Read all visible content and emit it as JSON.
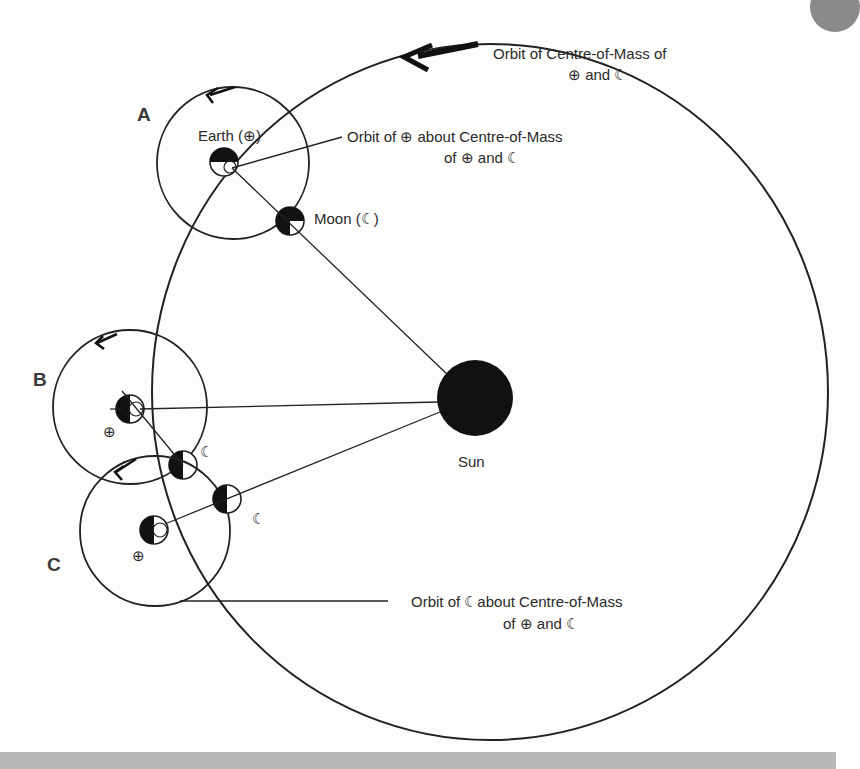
{
  "diagram": {
    "positions": [
      {
        "id": "A",
        "label": "A"
      },
      {
        "id": "B",
        "label": "B"
      },
      {
        "id": "C",
        "label": "C"
      }
    ],
    "labels": {
      "earth": "Earth (⊕)",
      "moon": "Moon (☾)",
      "sun": "Sun",
      "com_orbit_line1": "Orbit of Centre-of-Mass of",
      "com_orbit_line2": "⊕ and ☾",
      "earth_orbit_line1": "Orbit of ⊕ about Centre-of-Mass",
      "earth_orbit_line2": "of ⊕ and ☾",
      "moon_orbit_line1": "Orbit of ☾about Centre-of-Mass",
      "moon_orbit_line2": "of ⊕ and ☾",
      "earth_symbol": "⊕",
      "moon_symbol": "☾"
    },
    "colors": {
      "ink": "#222222",
      "background": "#fdfdfc",
      "sun": "#111111"
    }
  }
}
